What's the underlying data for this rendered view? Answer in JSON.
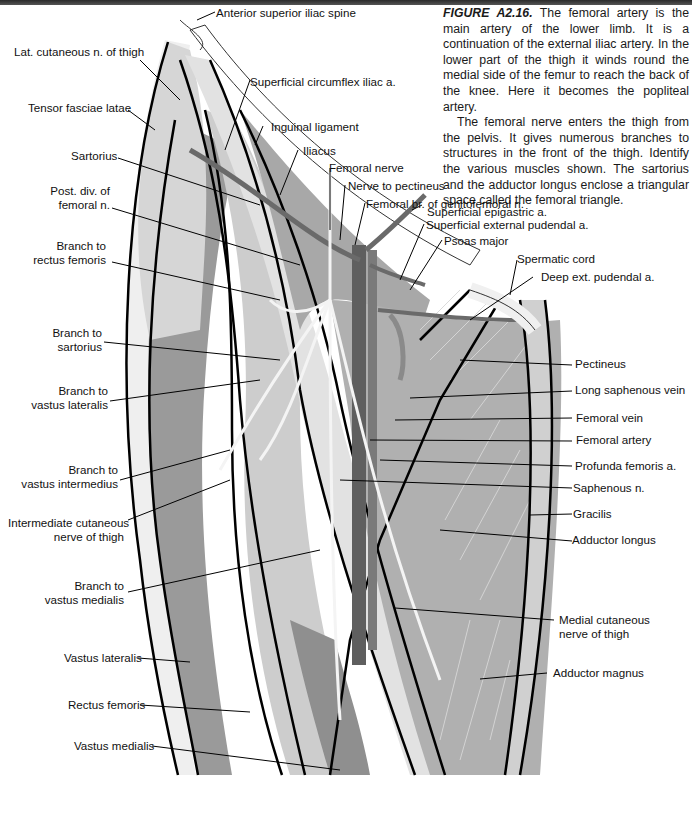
{
  "caption": {
    "figure_id": "FIGURE A2.16.",
    "paragraph1": " The femoral artery is the main artery of the lower limb. It is a continuation of the external iliac artery. In the lower part of the thigh it winds round the medial side of the femur to reach the back of the knee. Here it becomes the popliteal artery.",
    "paragraph2": "The femoral nerve enters the thigh from the pelvis. It gives numerous branches to structures in the front of the thigh. Identify the various muscles shown. The sartorius and the adductor longus enclose a triangular space called the femoral triangle."
  },
  "labels": {
    "left": [
      {
        "id": "lat-cutaneous-n-thigh",
        "text": "Lat. cutaneous n. of thigh"
      },
      {
        "id": "tensor-fasciae-latae",
        "text": "Tensor fasciae latae"
      },
      {
        "id": "sartorius",
        "text": "Sartorius"
      },
      {
        "id": "post-div-femoral-n",
        "line1": "Post. div. of",
        "line2": "femoral n."
      },
      {
        "id": "branch-rectus-femoris",
        "line1": "Branch to",
        "line2": "rectus femoris"
      },
      {
        "id": "branch-sartorius",
        "line1": "Branch to",
        "line2": "sartorius"
      },
      {
        "id": "branch-vastus-lateralis",
        "line1": "Branch to",
        "line2": "vastus lateralis"
      },
      {
        "id": "branch-vastus-intermedius",
        "line1": "Branch to",
        "line2": "vastus intermedius"
      },
      {
        "id": "intermediate-cutaneous-nerve",
        "line1": "Intermediate cutaneous",
        "line2": "nerve of thigh"
      },
      {
        "id": "branch-vastus-medialis",
        "line1": "Branch to",
        "line2": "vastus medialis"
      },
      {
        "id": "vastus-lateralis",
        "text": "Vastus lateralis"
      },
      {
        "id": "rectus-femoris",
        "text": "Rectus femoris"
      },
      {
        "id": "vastus-medialis",
        "text": "Vastus medialis"
      }
    ],
    "top": [
      {
        "id": "anterior-superior-iliac-spine",
        "text": "Anterior superior iliac spine"
      },
      {
        "id": "superficial-circumflex-iliac-a",
        "text": "Superficial circumflex iliac a."
      },
      {
        "id": "inguinal-ligament",
        "text": "Inguinal ligament"
      },
      {
        "id": "iliacus",
        "text": "Iliacus"
      },
      {
        "id": "femoral-nerve",
        "text": "Femoral nerve"
      },
      {
        "id": "nerve-to-pectineus",
        "text": "Nerve to pectineus"
      },
      {
        "id": "femoral-br-genitofemoral",
        "text": "Femoral br. of genitofemoral n."
      },
      {
        "id": "superficial-epigastric-a",
        "text": "Superficial epigastric a."
      },
      {
        "id": "superficial-external-pudendal-a",
        "text": "Superficial external pudendal a."
      },
      {
        "id": "psoas-major",
        "text": "Psoas major"
      },
      {
        "id": "spermatic-cord",
        "text": "Spermatic cord"
      },
      {
        "id": "deep-ext-pudendal-a",
        "text": "Deep ext. pudendal a."
      }
    ],
    "right": [
      {
        "id": "pectineus",
        "text": "Pectineus"
      },
      {
        "id": "long-saphenous-vein",
        "text": "Long saphenous vein"
      },
      {
        "id": "femoral-vein",
        "text": "Femoral vein"
      },
      {
        "id": "femoral-artery",
        "text": "Femoral artery"
      },
      {
        "id": "profunda-femoris-a",
        "text": "Profunda femoris a."
      },
      {
        "id": "saphenous-n",
        "text": "Saphenous n."
      },
      {
        "id": "gracilis",
        "text": "Gracilis"
      },
      {
        "id": "adductor-longus",
        "text": "Adductor longus"
      },
      {
        "id": "medial-cutaneous-nerve",
        "line1": "Medial cutaneous",
        "line2": "nerve of thigh"
      },
      {
        "id": "adductor-magnus",
        "text": "Adductor magnus"
      }
    ]
  },
  "colors": {
    "light_muscle": "#d4d4d4",
    "mid_muscle": "#b4b4b4",
    "dark_muscle": "#8c8c8c",
    "vessel": "#6a6a6a",
    "outline": "#000000"
  }
}
